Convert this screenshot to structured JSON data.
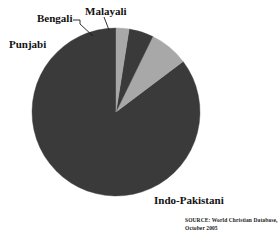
{
  "chart_data": {
    "type": "pie",
    "title": "",
    "subtitle": "",
    "xlabel": "",
    "ylabel": "",
    "legend_position": "none",
    "grid": false,
    "labels_outside": true,
    "start_angle_deg": 0,
    "direction": "clockwise",
    "categories": [
      "Indo-Pakistani",
      "Punjabi",
      "Bengali",
      "Malayali"
    ],
    "values": [
      85.5,
      7.5,
      4.5,
      2.5
    ],
    "unit": "percent",
    "slices": [
      {
        "label": "Indo-Pakistani",
        "value": 85.5,
        "color": "#3a3a3a",
        "start_deg": 53,
        "end_deg": 360
      },
      {
        "label": "Punjabi",
        "value": 7.5,
        "color": "#a8a8a8",
        "start_deg": 26,
        "end_deg": 53
      },
      {
        "label": "Bengali",
        "value": 4.5,
        "color": "#3a3a3a",
        "start_deg": 9,
        "end_deg": 26
      },
      {
        "label": "Malayali",
        "value": 2.5,
        "color": "#a8a8a8",
        "start_deg": 0,
        "end_deg": 9
      }
    ],
    "annotations": [
      "SOURCE: World Christian Database,",
      "October 2005"
    ]
  },
  "labels": {
    "punjabi": "Punjabi",
    "bengali": "Bengali",
    "malayali": "Malayali",
    "indo_pakistani": "Indo-Pakistani"
  },
  "source": {
    "line1": "SOURCE: World Christian Database,",
    "line2": "October 2005"
  },
  "colors": {
    "dark_slice": "#3a3a3a",
    "light_slice": "#a8a8a8",
    "background": "#ffffff",
    "text": "#111111",
    "leader_line": "#1a1a1a"
  },
  "geometry": {
    "center_x": 116,
    "center_y": 112,
    "radius": 84
  }
}
